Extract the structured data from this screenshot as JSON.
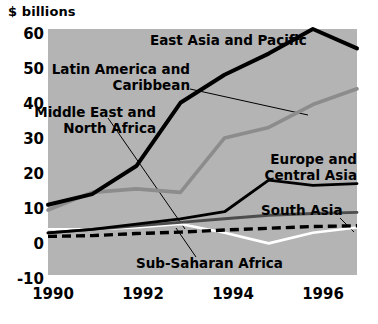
{
  "chart_data": {
    "type": "line",
    "title": "",
    "ylabel": "$ billions",
    "xlabel": "",
    "ylim": [
      -10,
      60
    ],
    "xlim": [
      1990,
      1997
    ],
    "grid": false,
    "legend_position": "inline-annotations",
    "plot_background": "#b4b4b4",
    "ytick_labels": [
      "60",
      "50",
      "40",
      "30",
      "20",
      "10",
      "0",
      "-10"
    ],
    "ytick_values": [
      60,
      50,
      40,
      30,
      20,
      10,
      0,
      -10
    ],
    "xtick_labels": [
      "1990",
      "1992",
      "1994",
      "1996"
    ],
    "xtick_values": [
      1990,
      1992,
      1994,
      1996
    ],
    "x": [
      1990,
      1991,
      1992,
      1993,
      1994,
      1995,
      1996,
      1997
    ],
    "series": [
      {
        "name": "East Asia and Pacific",
        "color": "#000000",
        "style": "solid-thick",
        "values": [
          10,
          13,
          21,
          39,
          47,
          53,
          60,
          54.5
        ]
      },
      {
        "name": "Latin America and Caribbean",
        "color": "#8c8c8c",
        "style": "solid-thick",
        "values": [
          8.5,
          13.5,
          14.5,
          13.5,
          29,
          32,
          38.5,
          43
        ]
      },
      {
        "name": "Middle East and North Africa",
        "color": "#4d4d4d",
        "style": "solid-medium",
        "values": [
          2,
          3,
          4,
          5,
          6,
          7,
          7.5,
          7.8
        ]
      },
      {
        "name": "Europe and Central Asia",
        "color": "#000000",
        "style": "solid",
        "values": [
          2,
          3,
          4.5,
          6,
          8,
          17,
          15.5,
          16
        ]
      },
      {
        "name": "South Asia",
        "color": "#000000",
        "style": "dashed",
        "values": [
          1,
          1.2,
          1.8,
          2.2,
          2.8,
          3.3,
          3.8,
          4
        ]
      },
      {
        "name": "Sub-Saharan Africa",
        "color": "#ffffff",
        "style": "solid",
        "values": [
          3,
          3,
          3.5,
          4.5,
          2,
          -1,
          2,
          3.5
        ]
      }
    ],
    "annotations": [
      {
        "id": "east-asia-and-pacific",
        "label": "East Asia and Pacific"
      },
      {
        "id": "latin-america-and-caribbean",
        "label_line1": "Latin America and",
        "label_line2": "Caribbean"
      },
      {
        "id": "middle-east-and-north-africa",
        "label_line1": "Middle East and",
        "label_line2": "North Africa"
      },
      {
        "id": "europe-and-central-asia",
        "label_line1": "Europe and",
        "label_line2": "Central Asia"
      },
      {
        "id": "south-asia",
        "label": "South Asia"
      },
      {
        "id": "sub-saharan-africa",
        "label": "Sub-Saharan Africa"
      }
    ]
  },
  "labels": {
    "axis_title": "$ billions",
    "y": {
      "t60": "60",
      "t50": "50",
      "t40": "40",
      "t30": "30",
      "t20": "20",
      "t10": "10",
      "t0": "0",
      "tm10": "-10"
    },
    "x": {
      "x1990": "1990",
      "x1992": "1992",
      "x1994": "1994",
      "x1996": "1996"
    },
    "ann": {
      "east_asia": "East Asia and Pacific",
      "latin_1": "Latin America and",
      "latin_2": "Caribbean",
      "mena_1": "Middle East and",
      "mena_2": "North Africa",
      "europe_1": "Europe and",
      "europe_2": "Central Asia",
      "south_asia": "South Asia",
      "ssa": "Sub-Saharan Africa"
    }
  }
}
